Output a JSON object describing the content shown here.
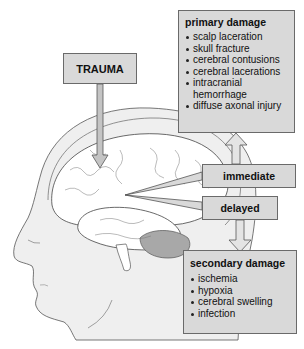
{
  "trauma": {
    "label": "TRAUMA"
  },
  "primary": {
    "title": "primary damage",
    "items": [
      "scalp laceration",
      "skull fracture",
      "cerebral contusions",
      "cerebral lacerations",
      "intracranial hemorrhage",
      "diffuse axonal injury"
    ]
  },
  "immediate": {
    "label": "immediate"
  },
  "delayed": {
    "label": "delayed"
  },
  "secondary": {
    "title": "secondary damage",
    "items": [
      "ischemia",
      "hypoxia",
      "cerebral swelling",
      "infection"
    ]
  },
  "colors": {
    "box_fill": "#d9d9d9",
    "box_border": "#6a6a6a",
    "head_fill": "#efefef",
    "brain_fill": "#ffffff",
    "cerebellum": "#a8a8a8"
  }
}
